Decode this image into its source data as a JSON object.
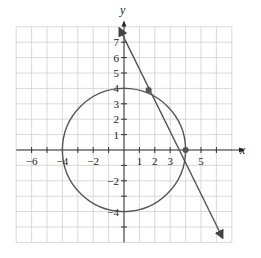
{
  "chart_data": {
    "type": "scatter",
    "title": "",
    "xlabel": "x",
    "ylabel": "y",
    "xlim": [
      -7,
      7
    ],
    "ylim": [
      -6,
      8
    ],
    "grid": true,
    "x_tick_labels": [
      "-6",
      "-4",
      "-2",
      "1",
      "2",
      "3",
      "5"
    ],
    "y_tick_labels": [
      "7",
      "6",
      "5",
      "4",
      "3",
      "2",
      "1",
      "-2",
      "-4"
    ],
    "series": [
      {
        "name": "circle",
        "kind": "circle",
        "center": [
          0,
          0
        ],
        "radius": 4
      },
      {
        "name": "line",
        "kind": "line",
        "points": [
          [
            -0.3,
            7.9
          ],
          [
            6.4,
            -5.7
          ]
        ],
        "arrows": "both"
      }
    ],
    "intersection_points": [
      [
        1.6,
        3.9
      ],
      [
        4,
        0
      ]
    ],
    "colors": {
      "grid": "#cfcfcf",
      "axis": "#333333",
      "curve": "#555555"
    }
  },
  "labels": {
    "x_axis": "x",
    "y_axis": "y",
    "x_ticks": [
      {
        "v": -6,
        "t": "−6"
      },
      {
        "v": -4,
        "t": "−4"
      },
      {
        "v": -2,
        "t": "−2"
      },
      {
        "v": 1,
        "t": "1"
      },
      {
        "v": 2,
        "t": "2"
      },
      {
        "v": 3,
        "t": "3"
      },
      {
        "v": 5,
        "t": "5"
      }
    ],
    "y_ticks": [
      {
        "v": 7,
        "t": "7"
      },
      {
        "v": 6,
        "t": "6"
      },
      {
        "v": 5,
        "t": "5"
      },
      {
        "v": 4,
        "t": "4"
      },
      {
        "v": 3,
        "t": "3"
      },
      {
        "v": 2,
        "t": "2"
      },
      {
        "v": 1,
        "t": "1"
      },
      {
        "v": -2,
        "t": "−2"
      },
      {
        "v": -4,
        "t": "−4"
      }
    ]
  }
}
